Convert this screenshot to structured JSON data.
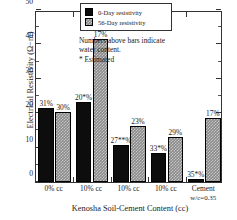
{
  "chart_data": {
    "type": "bar",
    "title": "",
    "xlabel": "Kenosha Soil-Cement Content (cc)",
    "ylabel": "Electrical Resistivity (Ω−m)",
    "ylim": [
      0,
      50
    ],
    "yticks": [
      0,
      10,
      20,
      30,
      40,
      50
    ],
    "ytick_labels": [
      "0",
      "10",
      "20",
      "30",
      "40",
      "50"
    ],
    "grid": false,
    "legend_position": "top-center",
    "categories": [
      "0% cc",
      "10% cc",
      "10% cc",
      "10% cc",
      "Cement"
    ],
    "category_sublabels": [
      "",
      "",
      "",
      "",
      "w/c=0.35"
    ],
    "series": [
      {
        "name": "0-Day resistivity",
        "color": "#0d0d0d",
        "values": [
          21.5,
          23.3,
          10.7,
          8.3,
          0.8
        ],
        "point_labels": [
          "31%",
          "20*%",
          "27**%",
          "33*%",
          "35*%"
        ]
      },
      {
        "name": "56-Day resistivity",
        "color": "#8a8a8a",
        "values": [
          20.3,
          41.5,
          16.2,
          13.0,
          18.7
        ],
        "point_labels": [
          "30%",
          "17%",
          "23%",
          "29%",
          "17%"
        ]
      }
    ],
    "annotations": [
      "Numbers above bars indicate",
      "water content.",
      "* Estimated"
    ]
  }
}
